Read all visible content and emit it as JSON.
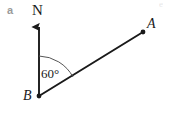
{
  "figure": {
    "part_label": "a",
    "north_label": "N",
    "angle_label": "60°",
    "point_a_label": "A",
    "point_b_label": "B",
    "corner_artifact": "e",
    "colors": {
      "background": "#ffffff",
      "stroke": "#1a1a1a",
      "arc_stroke": "#555555",
      "part_label": "#9a9a9a",
      "text": "#1a1a1a"
    },
    "geometry": {
      "vertex_b": [
        39,
        96
      ],
      "point_a": [
        143,
        32
      ],
      "north_tip": [
        39,
        22
      ],
      "north_base": [
        39,
        96
      ],
      "arc_radius": 40,
      "bearing_degrees": 60
    }
  }
}
